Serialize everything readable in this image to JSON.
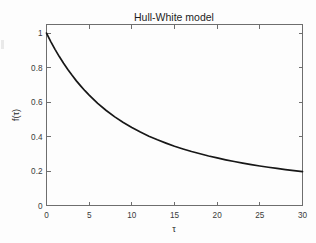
{
  "chart_data": {
    "type": "line",
    "title": "Hull-White model",
    "xlabel": "τ",
    "ylabel": "f(τ)",
    "xlim": [
      0,
      30
    ],
    "ylim": [
      0,
      1.05
    ],
    "grid": false,
    "legend": null,
    "xticks": [
      0,
      5,
      10,
      15,
      20,
      25,
      30
    ],
    "xtick_labels": [
      "0",
      "5",
      "10",
      "15",
      "20",
      "25",
      "30"
    ],
    "yticks": [
      0,
      0.2,
      0.4,
      0.6,
      0.8,
      1
    ],
    "ytick_labels": [
      "0",
      "0.2",
      "0.4",
      "0.6",
      "0.8",
      "1"
    ],
    "line_color": "#171717",
    "series": [
      {
        "name": "f(τ)",
        "x": [
          0,
          0.5,
          1,
          1.5,
          2,
          2.5,
          3,
          3.5,
          4,
          4.5,
          5,
          6,
          7,
          8,
          9,
          10,
          11,
          12,
          13,
          14,
          15,
          16,
          17,
          18,
          19,
          20,
          21,
          22,
          23,
          24,
          25,
          26,
          27,
          28,
          29,
          30
        ],
        "y": [
          1.0,
          0.951,
          0.906,
          0.864,
          0.825,
          0.789,
          0.755,
          0.723,
          0.694,
          0.666,
          0.64,
          0.592,
          0.551,
          0.514,
          0.481,
          0.452,
          0.426,
          0.402,
          0.381,
          0.362,
          0.344,
          0.328,
          0.313,
          0.3,
          0.287,
          0.276,
          0.265,
          0.255,
          0.246,
          0.237,
          0.229,
          0.222,
          0.215,
          0.208,
          0.202,
          0.196
        ]
      }
    ],
    "endpoint_value": 0.17,
    "start_value": 1.0
  },
  "figure": {
    "background_color": "#fdfdfd",
    "axes_color": "#6e6e6e",
    "title_text": "Hull-White model"
  }
}
